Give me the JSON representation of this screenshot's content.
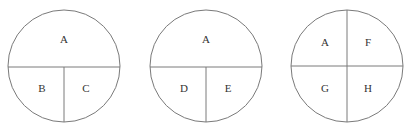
{
  "diagram": {
    "stroke_color": "#7a7a7a",
    "text_color": "#333333",
    "circles": [
      {
        "id": "circle-1",
        "cx": 64,
        "cy": 66,
        "r": 56,
        "lines": [
          {
            "x1": 8,
            "y1": 67,
            "x2": 120,
            "y2": 67
          },
          {
            "x1": 64,
            "y1": 67,
            "x2": 64,
            "y2": 122
          }
        ],
        "regions": [
          {
            "label": "A",
            "x": 64,
            "y": 40
          },
          {
            "label": "B",
            "x": 42,
            "y": 89
          },
          {
            "label": "C",
            "x": 86,
            "y": 89
          }
        ]
      },
      {
        "id": "circle-2",
        "cx": 206,
        "cy": 66,
        "r": 56,
        "lines": [
          {
            "x1": 150,
            "y1": 67,
            "x2": 262,
            "y2": 67
          },
          {
            "x1": 206,
            "y1": 67,
            "x2": 206,
            "y2": 122
          }
        ],
        "regions": [
          {
            "label": "A",
            "x": 206,
            "y": 40
          },
          {
            "label": "D",
            "x": 184,
            "y": 89
          },
          {
            "label": "E",
            "x": 228,
            "y": 89
          }
        ]
      },
      {
        "id": "circle-3",
        "cx": 347,
        "cy": 66,
        "r": 56,
        "lines": [
          {
            "x1": 291,
            "y1": 66,
            "x2": 403,
            "y2": 66
          },
          {
            "x1": 347,
            "y1": 10,
            "x2": 347,
            "y2": 122
          }
        ],
        "regions": [
          {
            "label": "A",
            "x": 325,
            "y": 43
          },
          {
            "label": "F",
            "x": 368,
            "y": 43
          },
          {
            "label": "G",
            "x": 325,
            "y": 89
          },
          {
            "label": "H",
            "x": 368,
            "y": 89
          }
        ]
      }
    ]
  }
}
